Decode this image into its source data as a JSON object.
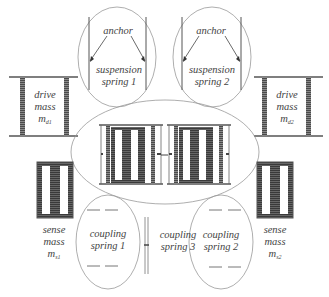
{
  "colors": {
    "line": "#555555",
    "mass_fill": "#6a6a6a",
    "outline": "#999999",
    "text": "#444444"
  },
  "labels": {
    "suspension_spring_1": {
      "anchor": "anchor",
      "line1": "suspension",
      "line2": "spring 1"
    },
    "suspension_spring_2": {
      "anchor": "anchor",
      "line1": "suspension",
      "line2": "spring 2"
    },
    "drive_mass_1": {
      "line1": "drive",
      "line2": "mass",
      "symbol": "m",
      "subscript": "d1"
    },
    "drive_mass_2": {
      "line1": "drive",
      "line2": "mass",
      "symbol": "m",
      "subscript": "d2"
    },
    "sense_mass_1": {
      "line1": "sense",
      "line2": "mass",
      "symbol": "m",
      "subscript": "s1"
    },
    "sense_mass_2": {
      "line1": "sense",
      "line2": "mass",
      "symbol": "m",
      "subscript": "s2"
    },
    "coupling_spring_1": {
      "line1": "coupling",
      "line2": "spring 1"
    },
    "coupling_spring_2": {
      "line1": "coupling",
      "line2": "spring 2"
    },
    "coupling_spring_3": {
      "line1": "coupling",
      "line2": "spring 3"
    }
  }
}
